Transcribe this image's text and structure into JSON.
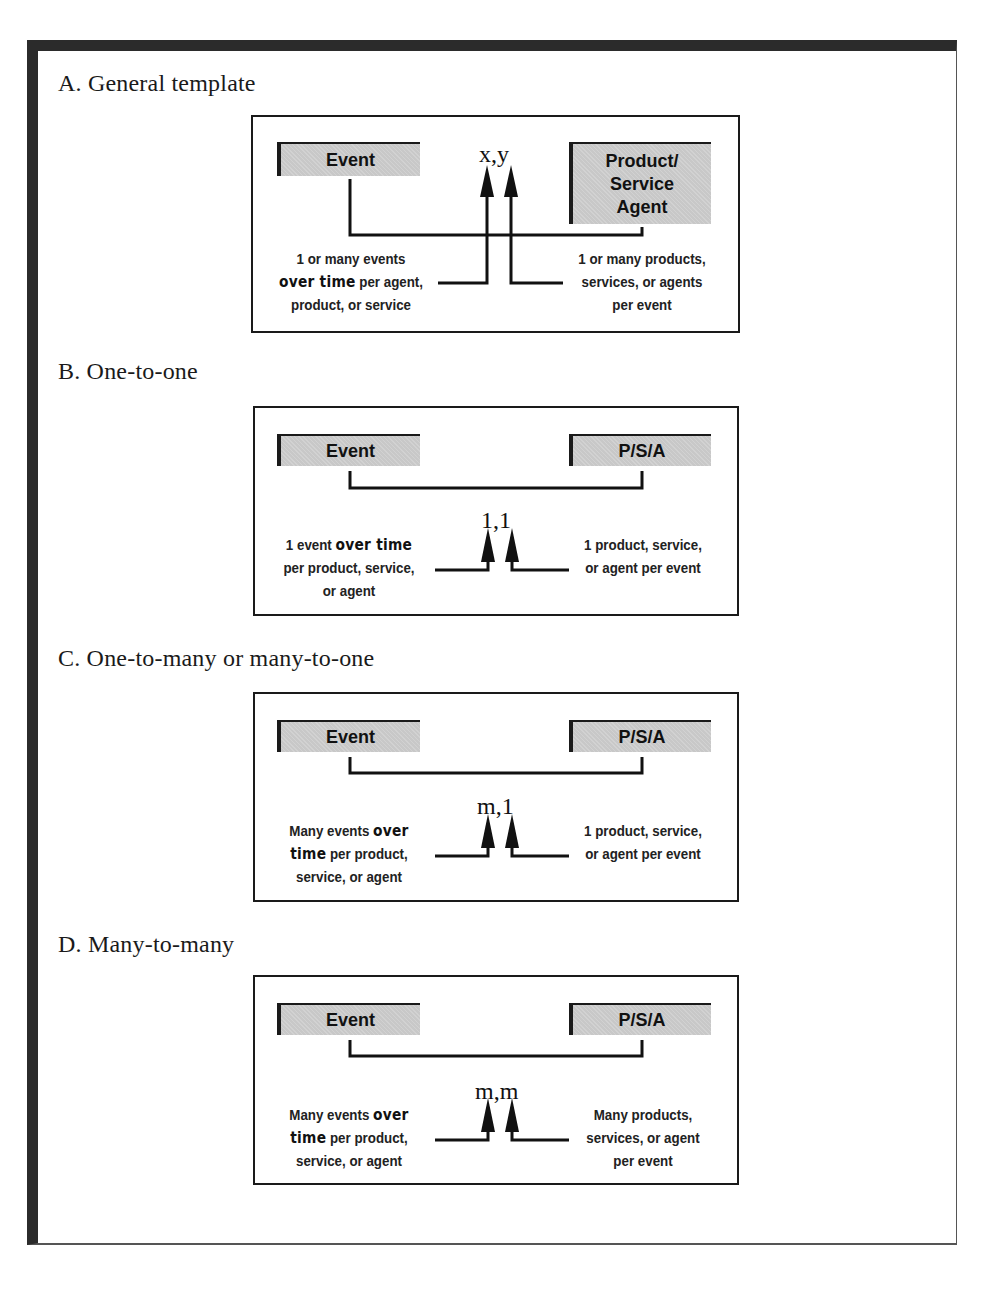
{
  "sections": [
    {
      "id": "A",
      "title": "A. General template",
      "left_box": "Event",
      "right_box_lines": [
        "Product/",
        "Service",
        "Agent"
      ],
      "cardinality": "x,y",
      "left_desc": {
        "line1": "1 or many events",
        "line2_em": "over time",
        "line2_rest": " per agent,",
        "line3": "product, or service"
      },
      "right_desc": {
        "line1": "1 or many products,",
        "line2": "services, or agents",
        "line3": "per event"
      }
    },
    {
      "id": "B",
      "title": "B. One-to-one",
      "left_box": "Event",
      "right_box": "P/S/A",
      "cardinality": "1,1",
      "left_desc": {
        "line1_pre": "1 event ",
        "line1_em": "over time",
        "line2": "per product, service,",
        "line3": "or agent"
      },
      "right_desc": {
        "line1": "1 product, service,",
        "line2": "or agent per event"
      }
    },
    {
      "id": "C",
      "title": "C. One-to-many or many-to-one",
      "left_box": "Event",
      "right_box": "P/S/A",
      "cardinality": "m,1",
      "left_desc": {
        "line1_pre": "Many events ",
        "line1_em": "over",
        "line2_em": "time",
        "line2_rest": " per product,",
        "line3": "service, or agent"
      },
      "right_desc": {
        "line1": "1 product, service,",
        "line2": "or agent per event"
      }
    },
    {
      "id": "D",
      "title": "D. Many-to-many",
      "left_box": "Event",
      "right_box": "P/S/A",
      "cardinality": "m,m",
      "left_desc": {
        "line1_pre": "Many events ",
        "line1_em": "over",
        "line2_em": "time",
        "line2_rest": " per product,",
        "line3": "service, or agent"
      },
      "right_desc": {
        "line1": "Many products,",
        "line2": "services, or agent",
        "line3": "per event"
      }
    }
  ],
  "colors": {
    "frame": "#2b2b2b",
    "box_fill": "#c8c8c8",
    "line": "#111111"
  }
}
